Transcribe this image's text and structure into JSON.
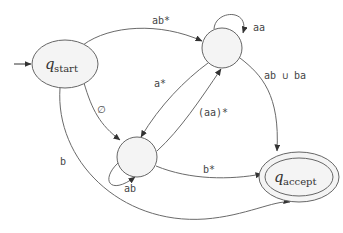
{
  "diagram": {
    "type": "finite-automaton",
    "states": [
      {
        "id": "start",
        "name": "q",
        "subscript": "start",
        "initial": true,
        "accepting": false
      },
      {
        "id": "s1",
        "name": "",
        "subscript": "",
        "initial": false,
        "accepting": false
      },
      {
        "id": "s2",
        "name": "",
        "subscript": "",
        "initial": false,
        "accepting": false
      },
      {
        "id": "accept",
        "name": "q",
        "subscript": "accept",
        "initial": false,
        "accepting": true
      }
    ],
    "transitions": [
      {
        "from": "start",
        "to": "s1",
        "label": "ab*"
      },
      {
        "from": "start",
        "to": "s2",
        "label": "∅"
      },
      {
        "from": "start",
        "to": "accept",
        "label": "b"
      },
      {
        "from": "s1",
        "to": "s1",
        "label": "aa"
      },
      {
        "from": "s1",
        "to": "s2",
        "label": "a*"
      },
      {
        "from": "s1",
        "to": "accept",
        "label": "ab ∪ ba"
      },
      {
        "from": "s2",
        "to": "s1",
        "label": "(aa)*"
      },
      {
        "from": "s2",
        "to": "s2",
        "label": "ab"
      },
      {
        "from": "s2",
        "to": "accept",
        "label": "b*"
      }
    ]
  },
  "labels": {
    "start_q": "q",
    "start_sub": "start",
    "accept_q": "q",
    "accept_sub": "accept",
    "e_start_s1": "ab*",
    "e_start_s2": "∅",
    "e_start_accept": "b",
    "e_s1_loop": "aa",
    "e_s1_s2": "a*",
    "e_s1_accept": "ab ∪ ba",
    "e_s2_s1": "(aa)*",
    "e_s2_loop": "ab",
    "e_s2_accept": "b*"
  },
  "colors": {
    "stroke": "#666666",
    "state_fill": "#f4f4f4",
    "text": "#444444"
  }
}
